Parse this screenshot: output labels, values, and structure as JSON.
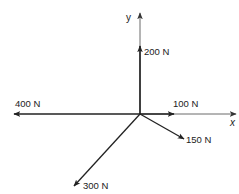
{
  "diagram": {
    "type": "force-vector-diagram",
    "colors": {
      "line": "#222222",
      "axis": "#555555",
      "background": "#ffffff"
    },
    "axes": {
      "x": {
        "label": "x"
      },
      "y": {
        "label": "y"
      }
    },
    "forces": [
      {
        "label": "200 N",
        "magnitude": 200,
        "unit": "N",
        "direction": "up (+y)"
      },
      {
        "label": "100 N",
        "magnitude": 100,
        "unit": "N",
        "direction": "right (+x)"
      },
      {
        "label": "400 N",
        "magnitude": 400,
        "unit": "N",
        "direction": "left (-x)"
      },
      {
        "label": "150 N",
        "magnitude": 150,
        "unit": "N",
        "direction": "down-right"
      },
      {
        "label": "300 N",
        "magnitude": 300,
        "unit": "N",
        "direction": "down-left"
      }
    ]
  }
}
